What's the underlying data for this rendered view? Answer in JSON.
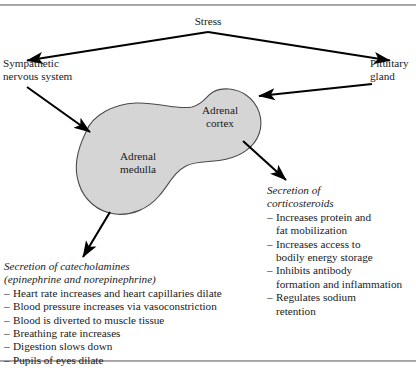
{
  "figure": {
    "shape_fill": "#d5d5d5",
    "shape_stroke": "#4a4a4a",
    "line_color": "#000000",
    "rule_color": "#8e8e8e"
  },
  "labels": {
    "stress": "Stress",
    "sympathetic": "Sympathetic\nnervous system",
    "pituitary": "Pituitary\ngland",
    "adrenal_cortex": "Adrenal\ncortex",
    "adrenal_medulla": "Adrenal\nmedulla"
  },
  "catecholamines": {
    "heading_line1": "Secretion of catecholamines",
    "heading_line2": "(epinephrine and norepinephrine)",
    "dash": "–",
    "items": [
      "Heart rate increases and heart capillaries dilate",
      "Blood pressure increases via vasoconstriction",
      "Blood is diverted to muscle tissue",
      "Breathing rate increases",
      "Digestion slows down",
      "Pupils of eyes dilate"
    ]
  },
  "corticosteroids": {
    "heading_line1": "Secretion of",
    "heading_line2": "corticosteroids",
    "dash": "–",
    "items": [
      "Increases protein and\nfat mobilization",
      "Increases access to\nbodily energy storage",
      "Inhibits antibody\nformation and inflammation",
      "Regulates sodium\nretention"
    ]
  },
  "arrows": [
    {
      "name": "stress-to-sympathetic",
      "from": [
        208,
        32
      ],
      "to": [
        25,
        61
      ]
    },
    {
      "name": "stress-to-pituitary",
      "from": [
        208,
        32
      ],
      "to": [
        392,
        61
      ]
    },
    {
      "name": "sympathetic-to-medulla",
      "from": [
        27,
        87
      ],
      "to": [
        92,
        134
      ]
    },
    {
      "name": "pituitary-to-cortex",
      "from": [
        372,
        84
      ],
      "to": [
        258,
        96
      ]
    },
    {
      "name": "cortex-to-corticosteroids",
      "from": [
        243,
        141
      ],
      "to": [
        287,
        181
      ]
    },
    {
      "name": "medulla-to-catecholamines",
      "from": [
        110,
        212
      ],
      "to": [
        82,
        259
      ]
    }
  ]
}
